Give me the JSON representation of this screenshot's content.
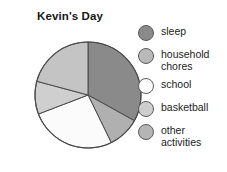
{
  "chart_data": {
    "type": "pie",
    "title": "Kevin's Day",
    "xlabel": "",
    "ylabel": "",
    "legend_position": "right",
    "grid": false,
    "categories": [
      "sleep",
      "household chores",
      "school",
      "basketball",
      "other activities"
    ],
    "values": [
      33,
      21,
      26,
      10,
      10
    ],
    "slices": [
      {
        "label": "sleep",
        "label_display": "sleep",
        "value": 33,
        "color": "#8a8a8a",
        "start_angle": 0,
        "end_angle": 119
      },
      {
        "label": "other activities",
        "label_display": "other\nactivities",
        "value": 10,
        "color": "#b0b0b0",
        "start_angle": 119,
        "end_angle": 154
      },
      {
        "label": "school",
        "label_display": "school",
        "value": 26,
        "color": "#fbfbfb",
        "start_angle": 154,
        "end_angle": 249
      },
      {
        "label": "basketball",
        "label_display": "basketball",
        "value": 10,
        "color": "#cfcfcf",
        "start_angle": 249,
        "end_angle": 285
      },
      {
        "label": "household chores",
        "label_display": "household\nchores",
        "value": 21,
        "color": "#c4c4c4",
        "start_angle": 285,
        "end_angle": 360
      }
    ]
  },
  "chart": {
    "title": "Kevin's Day",
    "center_x": 58,
    "center_y": 63,
    "radius": 53,
    "outline_color": "#4a4a4a"
  },
  "legend": {
    "items": [
      {
        "label": "sleep",
        "swatch_color": "#8a8a8a"
      },
      {
        "label": "household\nchores",
        "swatch_color": "#b9b9b9"
      },
      {
        "label": "school",
        "swatch_color": "#fcfcfc"
      },
      {
        "label": "basketball",
        "swatch_color": "#cdcdcd"
      },
      {
        "label": "other\nactivities",
        "swatch_color": "#b5b5b5"
      }
    ]
  }
}
